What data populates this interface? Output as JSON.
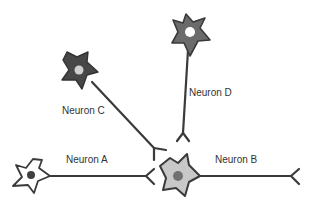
{
  "diagram": {
    "type": "neuron-circuit",
    "colors": {
      "line": "#3a3a3a",
      "dark_soma": "#4a4a4a",
      "mid_soma": "#6b6b6b",
      "light_soma": "#c8c8c8",
      "white_soma": "#ffffff",
      "light_nucleus": "#d6d6d6",
      "dark_nucleus": "#555555"
    },
    "neurons": [
      {
        "id": "A",
        "label": "Neuron A"
      },
      {
        "id": "B",
        "label": "Neuron B"
      },
      {
        "id": "C",
        "label": "Neuron C"
      },
      {
        "id": "D",
        "label": "Neuron D"
      }
    ]
  }
}
